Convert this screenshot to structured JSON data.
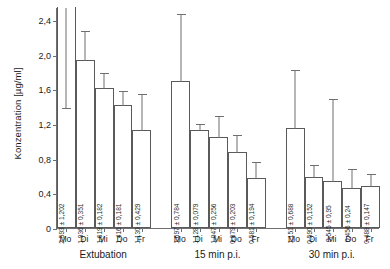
{
  "chart_data": {
    "type": "bar",
    "title": "",
    "xlabel": "",
    "ylabel": "Konzentration [µg/ml]",
    "ylim": [
      0,
      2.55
    ],
    "ytick_labels": [
      "0",
      "0,4",
      "0,8",
      "1,2",
      "1,6",
      "2,0",
      "2,4"
    ],
    "ytick_values": [
      0,
      0.4,
      0.8,
      1.2,
      1.6,
      2.0,
      2.4
    ],
    "grid": false,
    "legend": "none",
    "errorbar_style": "upper-whisker-with-cap",
    "categories": [
      "Mo",
      "Di",
      "Mi",
      "Do",
      "Fr"
    ],
    "groups": [
      "Extubation",
      "15 min p.i.",
      "30 min p.i."
    ],
    "series": [
      {
        "name": "Extubation",
        "values": [
          2.593,
          1.936,
          1.619,
          1.416,
          1.13
        ],
        "errors": [
          1.202,
          0.351,
          0.182,
          0.181,
          0.429
        ],
        "labels": [
          "2,593 ± 1,202",
          "1,936 ± 0,351",
          "1,619 ± 0,182",
          "1,416 ± 0,181",
          "1,130 ± 0,429"
        ],
        "clipped": [
          true,
          false,
          false,
          false,
          false
        ]
      },
      {
        "name": "15 min p.i.",
        "values": [
          1.697,
          1.128,
          1.047,
          0.879,
          0.581
        ],
        "errors": [
          0.784,
          0.079,
          0.256,
          0.203,
          0.194
        ],
        "labels": [
          "1,697 ± 0,784",
          "1,128 ± 0,079",
          "1,047 ± 0,256",
          "0,879 ± 0,203",
          "0,581 ± 0,194"
        ],
        "clipped": [
          false,
          false,
          false,
          false,
          false
        ]
      },
      {
        "name": "30 min p.i.",
        "values": [
          1.151,
          0.59,
          0.545,
          0.456,
          0.488
        ],
        "errors": [
          0.688,
          0.152,
          0.95,
          0.24,
          0.147
        ],
        "labels": [
          "1,151 ± 0,688",
          "0,590 ± 0,152",
          "0,545 ± 0,95",
          "0,456 ± 0,24",
          "0,488 ± 0,147"
        ],
        "clipped": [
          false,
          false,
          false,
          false,
          false
        ]
      }
    ]
  },
  "colors": {
    "background": "#ffffff",
    "axis": "#6f6f6f",
    "bar_edge": "#5a5a5a",
    "bar_fill": "#ffffff",
    "text": "#1a1a1a"
  }
}
